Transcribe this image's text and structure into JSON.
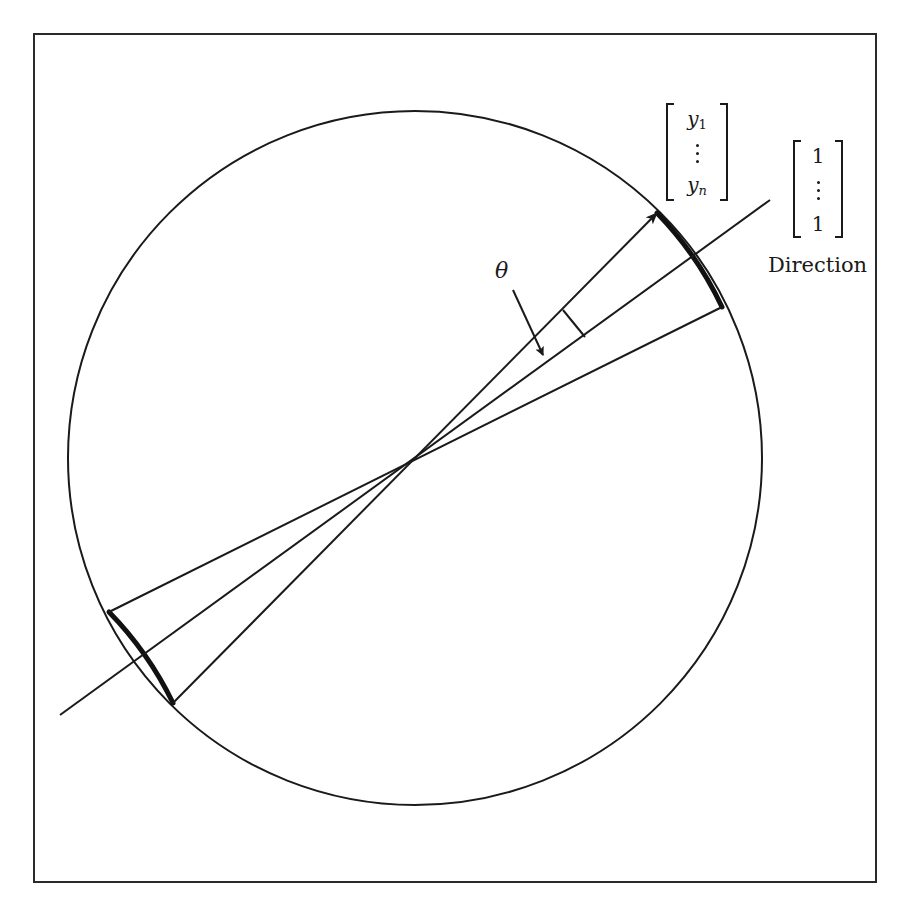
{
  "figure": {
    "frame": {
      "x": 33,
      "y": 33,
      "width": 844,
      "height": 850
    },
    "stroke_color": "#1a1a1a",
    "background_color": "#ffffff",
    "circle": {
      "cx": 415,
      "cy": 458,
      "r": 347
    },
    "center_point": {
      "x": 408,
      "y": 458
    },
    "lines": [
      {
        "name": "observation-vector-line",
        "from": [
          173,
          703
        ],
        "to": [
          657,
          213
        ],
        "arrow_at_end": true
      },
      {
        "name": "direction-line",
        "from": [
          60,
          715
        ],
        "to": [
          770,
          200
        ],
        "arrow_at_end": false
      },
      {
        "name": "cone-boundary-line",
        "from": [
          109,
          612
        ],
        "to": [
          722,
          307
        ],
        "arrow_at_end": false
      }
    ],
    "thick_arcs": [
      {
        "name": "upper-cap-arc",
        "from": [
          657,
          213
        ],
        "to": [
          722,
          307
        ]
      },
      {
        "name": "lower-cap-arc",
        "from": [
          109,
          612
        ],
        "to": [
          173,
          703
        ]
      }
    ],
    "right_angle_mark": {
      "from": [
        563,
        310
      ],
      "to": [
        585,
        337
      ]
    },
    "theta_pointer": {
      "from": [
        513,
        290
      ],
      "to": [
        543,
        355
      ]
    }
  },
  "labels": {
    "theta": "θ",
    "direction": "Direction"
  },
  "vector_y": {
    "first_entry": "y",
    "first_subscript": "1",
    "last_entry": "y",
    "last_subscript": "n"
  },
  "vector_ones": {
    "first_entry": "1",
    "last_entry": "1"
  }
}
